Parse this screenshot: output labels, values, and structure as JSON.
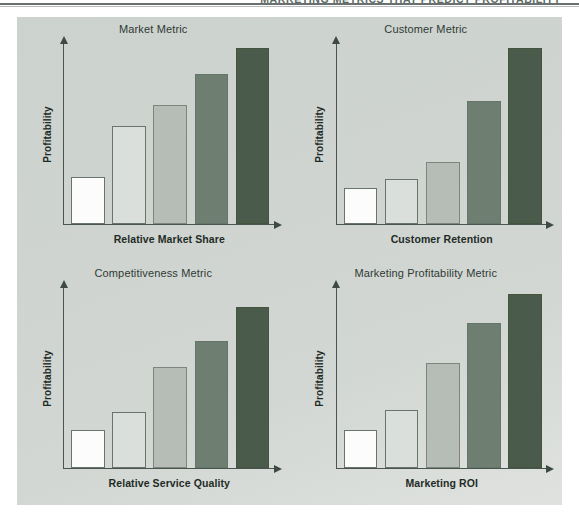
{
  "page": {
    "header_title": "MARKETING METRICS THAT PREDICT PROFITABILITY",
    "panel_background": "#ccd2ce"
  },
  "palette": {
    "bar_1": "#fbfcfb",
    "bar_2": "#dadfdb",
    "bar_3": "#b5bdb6",
    "bar_4": "#6e7f72",
    "bar_5": "#4a5b4c",
    "axis": "#4a5550",
    "title_text": "#2f3a35",
    "label_text": "#1f2b26"
  },
  "chart_data": [
    {
      "id": "market-metric",
      "type": "bar",
      "title": "Market Metric",
      "xlabel": "Relative Market Share",
      "ylabel": "Profitability",
      "categories": [
        "1",
        "2",
        "3",
        "4",
        "5"
      ],
      "values": [
        26,
        54,
        66,
        83,
        97
      ],
      "ylim": [
        0,
        100
      ],
      "grid": false,
      "legend": "none",
      "bar_colors": [
        "#fbfcfb",
        "#dadfdb",
        "#b5bdb6",
        "#6e7f72",
        "#4a5b4c"
      ]
    },
    {
      "id": "customer-metric",
      "type": "bar",
      "title": "Customer Metric",
      "xlabel": "Customer Retention",
      "ylabel": "Profitability",
      "categories": [
        "1",
        "2",
        "3",
        "4",
        "5"
      ],
      "values": [
        20,
        25,
        34,
        68,
        97
      ],
      "ylim": [
        0,
        100
      ],
      "grid": false,
      "legend": "none",
      "bar_colors": [
        "#fbfcfb",
        "#dadfdb",
        "#b5bdb6",
        "#6e7f72",
        "#4a5b4c"
      ]
    },
    {
      "id": "competitiveness-metric",
      "type": "bar",
      "title": "Competitiveness Metric",
      "xlabel": "Relative Service Quality",
      "ylabel": "Profitability",
      "categories": [
        "1",
        "2",
        "3",
        "4",
        "5"
      ],
      "values": [
        21,
        31,
        56,
        70,
        89
      ],
      "ylim": [
        0,
        100
      ],
      "grid": false,
      "legend": "none",
      "bar_colors": [
        "#fbfcfb",
        "#dadfdb",
        "#b5bdb6",
        "#6e7f72",
        "#4a5b4c"
      ]
    },
    {
      "id": "marketing-profitability-metric",
      "type": "bar",
      "title": "Marketing Profitability Metric",
      "xlabel": "Marketing ROI",
      "ylabel": "Profitability",
      "categories": [
        "1",
        "2",
        "3",
        "4",
        "5"
      ],
      "values": [
        21,
        32,
        58,
        80,
        96
      ],
      "ylim": [
        0,
        100
      ],
      "grid": false,
      "legend": "none",
      "bar_colors": [
        "#fbfcfb",
        "#dadfdb",
        "#b5bdb6",
        "#6e7f72",
        "#4a5b4c"
      ]
    }
  ]
}
